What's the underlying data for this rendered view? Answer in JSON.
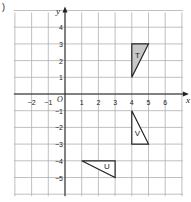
{
  "question_label": ")",
  "axes": {
    "x_label": "x",
    "y_label": "y",
    "origin_label": "O",
    "x_ticks": [
      "-2",
      "-1",
      "1",
      "2",
      "3",
      "4",
      "5",
      "6"
    ],
    "y_ticks": [
      "4",
      "3",
      "2",
      "1",
      "-1",
      "-2",
      "-3",
      "-4",
      "-5"
    ],
    "x_range": [
      -3,
      7
    ],
    "y_range": [
      -6,
      5
    ]
  },
  "shapes": [
    {
      "label": "T",
      "vertices": [
        [
          4,
          1
        ],
        [
          4,
          3
        ],
        [
          5,
          3
        ]
      ],
      "fill": "#c8c8c8"
    },
    {
      "label": "V",
      "vertices": [
        [
          4,
          -1
        ],
        [
          4,
          -3
        ],
        [
          5,
          -3
        ]
      ],
      "fill": "#ffffff"
    },
    {
      "label": "U",
      "vertices": [
        [
          1,
          -4
        ],
        [
          3,
          -4
        ],
        [
          3,
          -5
        ]
      ],
      "fill": "#ffffff"
    }
  ],
  "colors": {
    "grid": "#b0b0b0",
    "axis": "#222222",
    "shape_stroke": "#222222"
  }
}
